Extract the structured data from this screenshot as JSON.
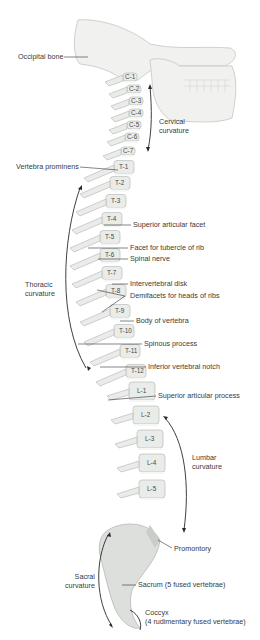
{
  "figure": {
    "colors": {
      "bone_fill": "#e9ece8",
      "bone_stroke": "#b9bdb8",
      "disk_fill": "#f6f6f4",
      "label_text": "#3a3a3a",
      "leader_line": "#333333",
      "sacrum_shade": "#c9ccc7"
    }
  },
  "labels": {
    "occipital_bone": "Occipital bone",
    "cervical_curvature": "Cervical\ncurvature",
    "vertebra_prominens": "Vertebra prominens",
    "superior_articular_facet": "Superior articular facet",
    "facet_tubercle": "Facet for tubercle of rib",
    "spinal_nerve": "Spinal nerve",
    "thoracic_curvature": "Thoracic\ncurvature",
    "intervertebral_disk": "Intervertebral disk",
    "demifacets": "Demifacets for heads of ribs",
    "body_of_vertebra": "Body of vertebra",
    "spinous_process": "Spinous process",
    "inferior_vertebral_notch": "Inferior vertebral notch",
    "superior_articular_process": "Superior articular process",
    "lumbar_curvature": "Lumbar\ncurvature",
    "promontory": "Promontory",
    "sacral_curvature": "Sacral\ncurvature",
    "sacrum": "Sacrum (5 fused vertebrae)",
    "coccyx": "Coccyx\n(4 rudimentary fused vertebrae)"
  },
  "vertebrae": {
    "cervical": [
      "C-1",
      "C-2",
      "C-3",
      "C-4",
      "C-5",
      "C-6",
      "C-7"
    ],
    "thoracic": [
      "T-1",
      "T-2",
      "T-3",
      "T-4",
      "T-5",
      "T-6",
      "T-7",
      "T-8",
      "T-9",
      "T-10",
      "T-11",
      "T-12"
    ],
    "lumbar": [
      "L-1",
      "L-2",
      "L-3",
      "L-4",
      "L-5"
    ]
  }
}
